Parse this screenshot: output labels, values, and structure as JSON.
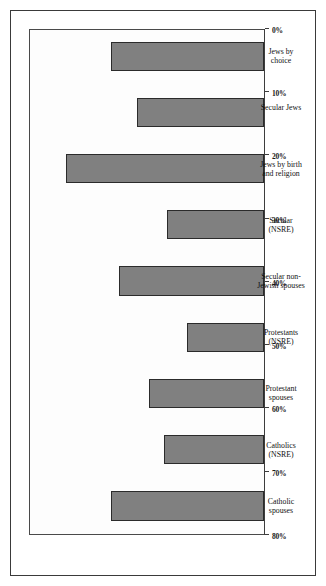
{
  "figure": {
    "orientation": "rotated-90",
    "frame_color": "#3a3a3a",
    "bar_fill": "#808080",
    "bar_border": "#2b2b2b"
  },
  "chart_data": {
    "type": "bar",
    "title": "",
    "subtitle": "",
    "xlabel": "",
    "ylabel": "",
    "orientation": "horizontal",
    "grid": false,
    "legend": null,
    "ylim": [
      0,
      80
    ],
    "tick_unit": "%",
    "tick_labels": [
      "80%",
      "70%",
      "60%",
      "50%",
      "40%",
      "30%",
      "20%",
      "10%",
      "0%"
    ],
    "tick_values": [
      80,
      70,
      60,
      50,
      40,
      30,
      20,
      10,
      0
    ],
    "categories": [
      "Catholic spouses",
      "Catholics (NSRE)",
      "Protestant spouses",
      "Protestants (NSRE)",
      "Secular non-Jewish spouses",
      "Secular (NSRE)",
      "Jews by birth and religion",
      "Secular Jews",
      "Jews by choice"
    ],
    "category_lines": [
      "Catholic\nspouses",
      "Catholics\n(NSRE)",
      "Protestant\nspouses",
      "Protestants\n(NSRE)",
      "Secular non-\nJewish spouses",
      "Secular\n(NSRE)",
      "Jews by birth\nand religion",
      "Secular Jews",
      "Jews by\nchoice"
    ],
    "values": [
      52,
      34,
      39,
      26,
      49,
      33,
      67,
      43,
      52
    ]
  }
}
